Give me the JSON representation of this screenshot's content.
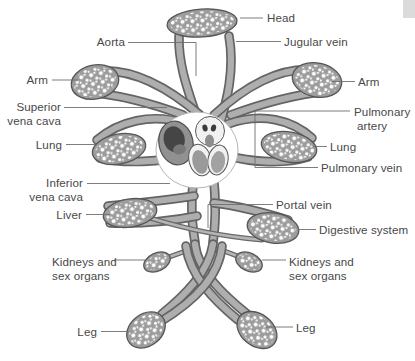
{
  "figure": {
    "type": "diagram",
    "labels": {
      "head": "Head",
      "jugular_vein": "Jugular vein",
      "aorta": "Aorta",
      "arm_left": "Arm",
      "arm_right": "Arm",
      "superior_vena_cava": {
        "line1": "Superior",
        "line2": "vena cava"
      },
      "pulmonary_artery": {
        "line1": "Pulmonary",
        "line2": "artery"
      },
      "lung_left": "Lung",
      "lung_right": "Lung",
      "pulmonary_vein": "Pulmonary vein",
      "inferior_vena_cava": {
        "line1": "Inferior",
        "line2": "vena cava"
      },
      "portal_vein": "Portal vein",
      "liver": "Liver",
      "digestive_system": "Digestive system",
      "kidneys_left": {
        "line1": "Kidneys and",
        "line2": "sex organs"
      },
      "kidneys_right": {
        "line1": "Kidneys and",
        "line2": "sex organs"
      },
      "leg_left": "Leg",
      "leg_right": "Leg"
    },
    "colors": {
      "background": "#ffffff",
      "vessel_fill": "#aeaeae",
      "vessel_outline": "#646464",
      "capillary_bed": "#9c9c9c",
      "heart_dark_chamber": "#454545",
      "label_text": "#484848",
      "leader_line": "#6e6e6e",
      "corner_block": "#dbdbdb"
    }
  }
}
